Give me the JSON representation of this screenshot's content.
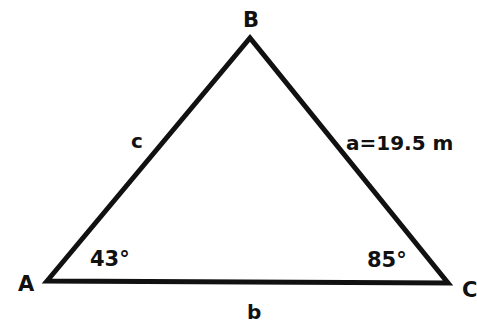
{
  "diagram": {
    "type": "triangle",
    "vertices": {
      "A": {
        "label": "A"
      },
      "B": {
        "label": "B"
      },
      "C": {
        "label": "C"
      }
    },
    "sides": {
      "a": {
        "label": "a=19.5 m"
      },
      "b": {
        "label": "b"
      },
      "c": {
        "label": "c"
      }
    },
    "angles": {
      "A": {
        "label": "43°"
      },
      "C": {
        "label": "85°"
      }
    },
    "stroke_color": "#111111"
  }
}
